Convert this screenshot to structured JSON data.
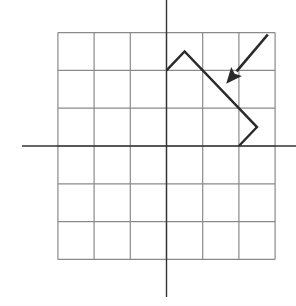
{
  "diagram": {
    "type": "coordinate-grid",
    "grid": {
      "cols": 6,
      "rows": 6,
      "x_range": [
        -3,
        3
      ],
      "y_range": [
        -3,
        3
      ],
      "origin_px": [
        166.5,
        146
      ],
      "cell_px": [
        36.2,
        37.8
      ],
      "line_color": "#8a8a8a"
    },
    "axes": {
      "x_axis": {
        "from_px": [
          22,
          146
        ],
        "to_px": [
          296,
          146
        ]
      },
      "y_axis": {
        "from_px": [
          166.5,
          0
        ],
        "to_px": [
          166.5,
          297
        ]
      },
      "color": "#333333"
    },
    "shape": {
      "name": "bent-path",
      "vertices_units": [
        [
          0,
          2
        ],
        [
          0.5,
          2.5
        ],
        [
          2.5,
          0.5
        ],
        [
          2,
          0
        ]
      ],
      "color": "#2a2a2a"
    },
    "arrow": {
      "name": "direction-arrow",
      "from_units": [
        2.8,
        2.95
      ],
      "to_units": [
        1.65,
        1.65
      ],
      "color": "#2a2a2a"
    }
  }
}
